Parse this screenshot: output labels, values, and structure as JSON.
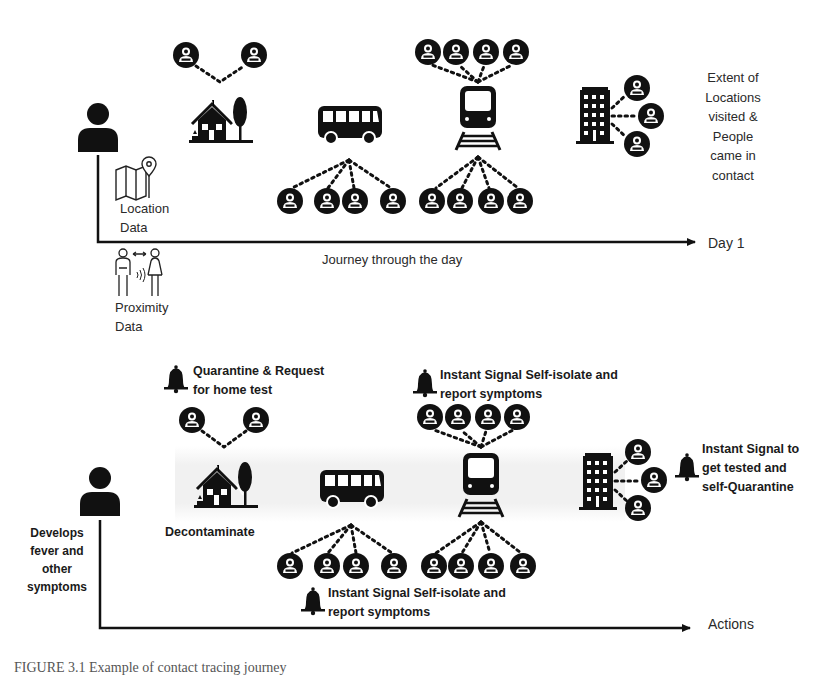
{
  "diagram": {
    "top_panel": {
      "axis_label": "Day 1",
      "journey_label": "Journey through the day",
      "extent_label_lines": [
        "Extent of",
        "Locations",
        "visited &",
        "People",
        "came in",
        "contact"
      ],
      "location_data_lines": [
        "Location",
        "Data"
      ],
      "proximity_data_lines": [
        "Proximity",
        "Data"
      ],
      "stops": [
        {
          "icon": "house-icon",
          "contacts": 2
        },
        {
          "icon": "bus-icon",
          "contacts": 4
        },
        {
          "icon": "train-icon",
          "contacts_above": 4,
          "contacts_below": 4
        },
        {
          "icon": "office-building-icon",
          "contacts": 3
        }
      ]
    },
    "bottom_panel": {
      "axis_label": "Actions",
      "person_note_lines": [
        "Develops",
        "fever and",
        "other",
        "symptoms"
      ],
      "house_action_lines": [
        "Quarantine & Request",
        "for home test"
      ],
      "house_caption": "Decontaminate",
      "train_alert_lines": [
        "Instant Signal Self-isolate and",
        "report symptoms"
      ],
      "bus_alert_lines": [
        "Instant Signal Self-isolate and",
        "report symptoms"
      ],
      "building_alert_lines": [
        "Instant Signal to",
        "get tested and",
        "self-Quarantine"
      ]
    },
    "caption_partial": "FIGURE 3.1  Example of contact tracing journey"
  }
}
